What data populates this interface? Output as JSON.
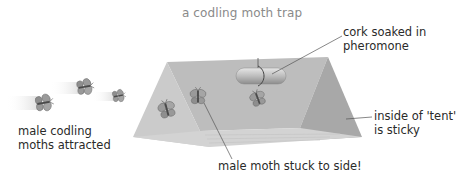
{
  "title": "a codling moth trap",
  "labels": {
    "attracted": [
      "male codling",
      "moths attracted"
    ],
    "cork": [
      "cork soaked in",
      "pheromone"
    ],
    "sticky": [
      "inside of 'tent'",
      "is sticky"
    ],
    "stuck": "male moth stuck to side!"
  },
  "colors": {
    "tent_back": "#b9b9b9",
    "tent_left_face": "#c8c8c8",
    "tent_right_face": "#a9a9a9",
    "tent_floor": "#d2d2d2",
    "title": "#8a8a8a",
    "text": "#2a2a2a",
    "leader_line": "#555555"
  },
  "diagram": {
    "components": [
      "flying moths",
      "triangular sticky tent",
      "pheromone cork",
      "stuck moths"
    ],
    "flying_moth_count": 3,
    "stuck_moth_count": 3
  }
}
